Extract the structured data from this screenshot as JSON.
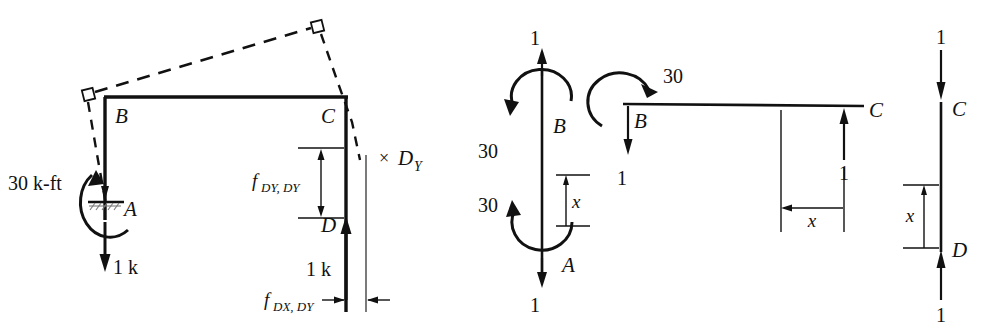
{
  "figure": {
    "plus_sign": "+",
    "ink_color": "#111111",
    "background": "#ffffff"
  },
  "diagram_frame": {
    "name": "deflected-frame-diagram",
    "nodes": {
      "A": "A",
      "B": "B",
      "C": "C",
      "D": "D"
    },
    "loads": {
      "moment": "30 k-ft",
      "vertical_a": "1 k",
      "vertical_d": "1 k"
    },
    "flexibility": {
      "dy_dy_main": "f",
      "dy_dy_sub": "DY, DY",
      "dx_dy_main": "f",
      "dx_dy_sub": "DX, DY"
    },
    "redundant": {
      "times": "×",
      "main": "D",
      "sub": "Y"
    }
  },
  "fbd_column_ab": {
    "name": "free-body-column-AB",
    "nodes": {
      "top": "B",
      "bottom": "A"
    },
    "forces": {
      "top_axial": "1",
      "bottom_axial": "1",
      "moment_top": "30",
      "moment_bottom": "30"
    },
    "dimension": "x"
  },
  "fbd_beam_bc": {
    "name": "free-body-beam-BC",
    "nodes": {
      "left": "B",
      "right": "C"
    },
    "forces": {
      "moment": "30",
      "left_shear": "1",
      "right_shear": "1"
    },
    "dimension": "x"
  },
  "fbd_column_cd": {
    "name": "free-body-column-CD",
    "nodes": {
      "top": "C",
      "bottom": "D"
    },
    "forces": {
      "top_axial": "1",
      "bottom_axial": "1"
    },
    "dimension": "x"
  }
}
